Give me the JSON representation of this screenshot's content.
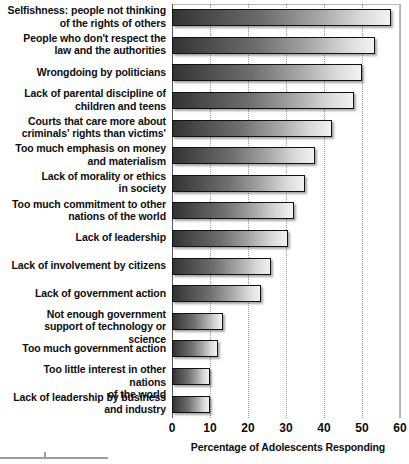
{
  "chart_data": {
    "type": "bar",
    "orientation": "horizontal",
    "title": "",
    "xlabel": "Percentage of Adolescents Responding",
    "ylabel": "",
    "xlim": [
      0,
      60
    ],
    "xticks": [
      0,
      10,
      20,
      30,
      40,
      50,
      60
    ],
    "xtick_labels": [
      "0",
      "10",
      "20",
      "30",
      "40",
      "50",
      "60"
    ],
    "grid": "vertical-dotted",
    "legend": "none",
    "categories": [
      "Selfishness: people not thinking of the rights of others",
      "People who don't respect the law and the authorities",
      "Wrongdoing by politicians",
      "Lack of parental discipline of children and teens",
      "Courts that care more about criminals' rights than victims'",
      "Too much emphasis on money and materialism",
      "Lack of morality or ethics in society",
      "Too much commitment to other nations of the world",
      "Lack of leadership",
      "Lack of involvement by citizens",
      "Lack of government action",
      "Not enough government support of technology or science",
      "Too much government action",
      "Too little interest in other nations of the world",
      "Lack of leadership by business and industry"
    ],
    "category_lines": [
      [
        "Selfishness: people not thinking",
        "of the rights of others"
      ],
      [
        "People who don't respect the",
        "law and the authorities"
      ],
      [
        "Wrongdoing by politicians"
      ],
      [
        "Lack of parental discipline of",
        "children and teens"
      ],
      [
        "Courts that care more about",
        "criminals' rights than victims'"
      ],
      [
        "Too much emphasis on money",
        "and materialism"
      ],
      [
        "Lack of morality or ethics",
        "in society"
      ],
      [
        "Too much commitment to other",
        "nations of the world"
      ],
      [
        "Lack of leadership"
      ],
      [
        "Lack of involvement by citizens"
      ],
      [
        "Lack of government action"
      ],
      [
        "Not enough government",
        "support of technology or science"
      ],
      [
        "Too much government action"
      ],
      [
        "Too little interest in other nations",
        "of the world"
      ],
      [
        "Lack of leadership by business",
        "and industry"
      ]
    ],
    "values": [
      57.5,
      53.5,
      50,
      48,
      42,
      37.5,
      35,
      32,
      30.5,
      26,
      23.5,
      13.5,
      12,
      10,
      10
    ]
  },
  "colors": {
    "bar_gradient_start": "#333333",
    "bar_gradient_end": "#f2f2f2",
    "bar_outline": "#111111",
    "axis": "#5a5a5a",
    "gridline": "#9a9a9a",
    "text": "#0d0d0d",
    "background": "#ffffff"
  }
}
